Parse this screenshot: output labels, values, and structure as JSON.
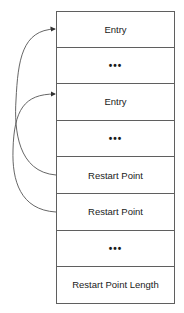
{
  "diagram": {
    "cells": [
      {
        "label": "Entry",
        "kind": "entry"
      },
      {
        "label": "•••",
        "kind": "ellipsis"
      },
      {
        "label": "Entry",
        "kind": "entry"
      },
      {
        "label": "•••",
        "kind": "ellipsis"
      },
      {
        "label": "Restart Point",
        "kind": "restart-point"
      },
      {
        "label": "Restart Point",
        "kind": "restart-point"
      },
      {
        "label": "•••",
        "kind": "ellipsis"
      },
      {
        "label": "Restart Point Length",
        "kind": "restart-length"
      }
    ],
    "arrows": [
      {
        "from": "cell-4",
        "to": "cell-0"
      },
      {
        "from": "cell-5",
        "to": "cell-2"
      }
    ],
    "colors": {
      "border": "#5f5f5f",
      "arrow": "#555555",
      "text": "#1a1a1a"
    }
  }
}
